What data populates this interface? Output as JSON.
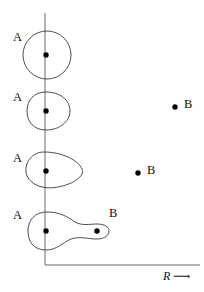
{
  "figure": {
    "background_color": "#ffffff",
    "stroke_color": "#3a3a3a",
    "axis_color": "#6b6b6b",
    "dot_color": "#000000",
    "width": 204,
    "height": 292
  },
  "axes": {
    "vertical": {
      "x": 45,
      "y_top": 13,
      "y_bottom": 265
    },
    "horizontal": {
      "y": 265,
      "x_left": 45,
      "x_right": 200
    },
    "x_axis_label": "R",
    "x_axis_arrow": "⟶",
    "y_axis_label": ""
  },
  "rows": [
    {
      "index": 1,
      "left_label": "A",
      "right_label": "",
      "shape": "circle",
      "shape_description": "circle centred on the vertical axis",
      "dots": [
        {
          "label": "A",
          "x": 46,
          "y": 55
        }
      ]
    },
    {
      "index": 2,
      "left_label": "A",
      "right_label": "",
      "shape": "oval",
      "shape_description": "slightly egg shaped oval bulging to the right",
      "dots": [
        {
          "label": "A",
          "x": 46,
          "y": 111
        }
      ]
    },
    {
      "index": 3,
      "left_label": "A",
      "right_label": "",
      "shape": "teardrop",
      "shape_description": "pear or teardrop contour tapering toward the right",
      "dots": [
        {
          "label": "A",
          "x": 46,
          "y": 171
        }
      ]
    },
    {
      "index": 4,
      "left_label": "A",
      "right_label": "B",
      "shape": "peanut",
      "shape_description": "dumbbell or peanut contour enclosing two centres",
      "dots": [
        {
          "label": "A",
          "x": 46,
          "y": 231
        },
        {
          "label": "B",
          "x": 97,
          "y": 231
        }
      ]
    }
  ],
  "free_points": [
    {
      "label": "B",
      "x": 175,
      "y": 107,
      "label_x": 184,
      "label_y": 99
    },
    {
      "label": "B",
      "x": 138,
      "y": 173,
      "label_x": 147,
      "label_y": 165
    }
  ],
  "labels": {
    "a1": "A",
    "a2": "A",
    "a3": "A",
    "a4": "A",
    "b_peanut": "B",
    "b_free_upper": "B",
    "b_free_lower": "B",
    "axis_r": "R",
    "axis_arrow": "⟶"
  }
}
